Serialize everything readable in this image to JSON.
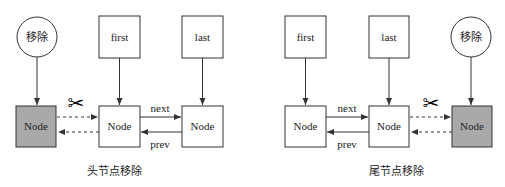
{
  "colors": {
    "stroke": "#333333",
    "removed_fill": "#a9a9a9",
    "node_fill": "#ffffff"
  },
  "icons": {
    "scissors": "✂"
  },
  "left": {
    "caption": "头节点移除",
    "remove_label": "移除",
    "first_label": "first",
    "last_label": "last",
    "removed_node_label": "Node",
    "node1_label": "Node",
    "node2_label": "Node",
    "next_label": "next",
    "prev_label": "prev"
  },
  "right": {
    "caption": "尾节点移除",
    "remove_label": "移除",
    "first_label": "first",
    "last_label": "last",
    "node1_label": "Node",
    "node2_label": "Node",
    "removed_node_label": "Node",
    "next_label": "next",
    "prev_label": "prev"
  }
}
